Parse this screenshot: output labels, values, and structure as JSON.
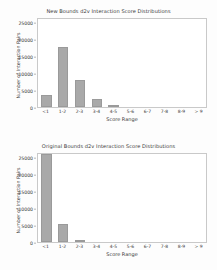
{
  "figure": {
    "background_color": "#fdfdfd",
    "bar_color": "#a9a9a9",
    "axis_color": "#c9c9c9"
  },
  "chart_data": [
    {
      "type": "bar",
      "title": "New Bounds d2v Interaction Score Distributions",
      "xlabel": "Score Range",
      "ylabel": "Number of Interaction Pairs",
      "categories": [
        "<1",
        "1-2",
        "2-3",
        "3-4",
        "4-5",
        "5-6",
        "6-7",
        "7-8",
        "8-9",
        "> 9"
      ],
      "values": [
        3600,
        17800,
        8000,
        2400,
        600,
        0,
        0,
        0,
        0,
        0
      ],
      "yticks": [
        0,
        5000,
        10000,
        15000,
        20000,
        25000
      ],
      "yticklabels": [
        "0",
        "5000",
        "10000",
        "15000",
        "20000",
        "25000"
      ],
      "ylim": [
        0,
        26500
      ],
      "grid": false,
      "legend": null
    },
    {
      "type": "bar",
      "title": "Original Bounds d2v Interaction Score Distributions",
      "xlabel": "Score Range",
      "ylabel": "Number of Interaction Pairs",
      "categories": [
        "<1",
        "1-2",
        "2-3",
        "3-4",
        "4-5",
        "5-6",
        "6-7",
        "7-8",
        "8-9",
        "> 9"
      ],
      "values": [
        25800,
        5200,
        600,
        0,
        0,
        0,
        0,
        0,
        0,
        0
      ],
      "yticks": [
        0,
        5000,
        10000,
        15000,
        20000,
        25000
      ],
      "yticklabels": [
        "0",
        "5000",
        "10000",
        "15000",
        "20000",
        "25000"
      ],
      "ylim": [
        0,
        26500
      ],
      "grid": false,
      "legend": null
    }
  ]
}
